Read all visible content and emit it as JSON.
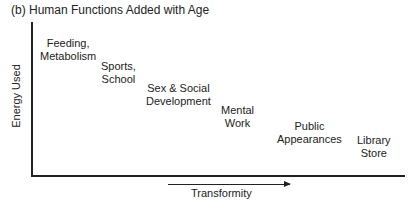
{
  "title": "(b)  Human Functions Added with Age",
  "axes": {
    "y_label": "Energy Used",
    "x_label": "Transformity"
  },
  "functions": [
    {
      "line1": "Feeding,",
      "line2": "Metabolism"
    },
    {
      "line1": "Sports,",
      "line2": "School"
    },
    {
      "line1": "Sex & Social",
      "line2": "Development"
    },
    {
      "line1": "Mental",
      "line2": "Work"
    },
    {
      "line1": "Public",
      "line2": "Appearances"
    },
    {
      "line1": "Library",
      "line2": "Store"
    }
  ],
  "colors": {
    "ink": "#222222",
    "background": "#ffffff"
  }
}
